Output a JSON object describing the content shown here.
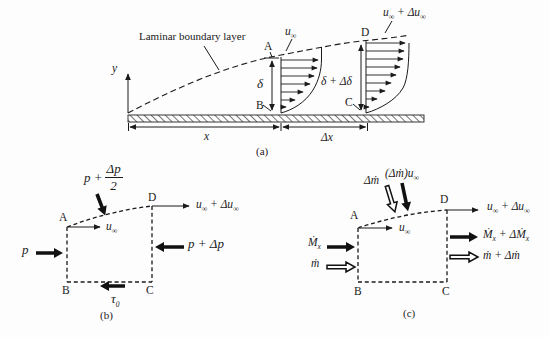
{
  "colors": {
    "ink": "#1b1b1b",
    "background": "#fdfdfd",
    "arrow_fill": "#111111"
  },
  "corners": {
    "a": "A",
    "b": "B",
    "c": "C",
    "d": "D"
  },
  "math": {
    "u": "u",
    "inf": "∞",
    "plus": " + ",
    "delta_u": "Δu",
    "y": "y",
    "x": "x",
    "delta_x": "Δx",
    "delta": "δ",
    "delta_plus_delta": "δ + Δδ",
    "p": "p",
    "p_plus_dp": "p + Δp",
    "p_plus": "p +",
    "dp_num": "Δp",
    "dp_den": "2",
    "tau": "τ",
    "tau_sub": "0",
    "M_dot": "Ṁ",
    "sub_x": "x",
    "m_dot": "ṁ",
    "dm_dot": "Δṁ",
    "dM_dot": "ΔṀ",
    "paren_open": "(",
    "paren_close": ")"
  },
  "panel_a": {
    "caption": "(a)",
    "boundary_layer_label": "Laminar boundary layer"
  },
  "panel_b": {
    "caption": "(b)"
  },
  "panel_c": {
    "caption": "(c)"
  }
}
